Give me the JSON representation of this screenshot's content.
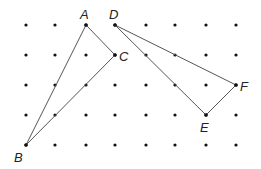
{
  "diagram": {
    "grid": {
      "columns_x": [
        26,
        55,
        86,
        115,
        146,
        175,
        206,
        236
      ],
      "rows_y": [
        25,
        55,
        85,
        115,
        145
      ],
      "dot_color": "#111111"
    },
    "points": {
      "A": {
        "label": "A",
        "x": 86,
        "y": 25,
        "lx": 80,
        "ly": 19
      },
      "B": {
        "label": "B",
        "x": 26,
        "y": 145,
        "lx": 14,
        "ly": 162
      },
      "C": {
        "label": "C",
        "x": 115,
        "y": 55,
        "lx": 119,
        "ly": 61
      },
      "D": {
        "label": "D",
        "x": 115,
        "y": 25,
        "lx": 109,
        "ly": 19
      },
      "E": {
        "label": "E",
        "x": 206,
        "y": 115,
        "lx": 200,
        "ly": 132
      },
      "F": {
        "label": "F",
        "x": 236,
        "y": 85,
        "lx": 240,
        "ly": 91
      }
    },
    "triangles": [
      {
        "name": "triangle-abc",
        "vertices": [
          "A",
          "B",
          "C"
        ]
      },
      {
        "name": "triangle-def",
        "vertices": [
          "D",
          "E",
          "F"
        ]
      }
    ],
    "line_color": "#555555"
  }
}
